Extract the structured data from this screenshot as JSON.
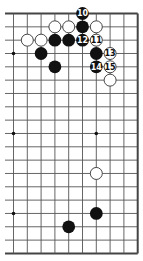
{
  "diagram": {
    "type": "go-board-partial",
    "board_size": 19,
    "visible_columns": [
      9,
      18
    ],
    "visible_rows": [
      0,
      18
    ],
    "edges": {
      "top": true,
      "right": true,
      "bottom": true,
      "left": false
    },
    "colors": {
      "line": "#555555",
      "edge": "#444444",
      "black": "#111111",
      "white": "#ffffff",
      "white_outline": "#333333",
      "background": "#ffffff"
    },
    "star_points": [
      {
        "col": 9,
        "row": 3
      },
      {
        "col": 9,
        "row": 9
      },
      {
        "col": 9,
        "row": 15
      },
      {
        "col": 15,
        "row": 9
      }
    ],
    "stones": [
      {
        "color": "black",
        "col": 14,
        "row": 0,
        "label": "10"
      },
      {
        "color": "white",
        "col": 12,
        "row": 1,
        "label": ""
      },
      {
        "color": "white",
        "col": 13,
        "row": 1,
        "label": ""
      },
      {
        "color": "black",
        "col": 14,
        "row": 1,
        "label": ""
      },
      {
        "color": "white",
        "col": 15,
        "row": 1,
        "label": ""
      },
      {
        "color": "white",
        "col": 10,
        "row": 2,
        "label": ""
      },
      {
        "color": "white",
        "col": 11,
        "row": 2,
        "label": ""
      },
      {
        "color": "black",
        "col": 12,
        "row": 2,
        "label": ""
      },
      {
        "color": "black",
        "col": 13,
        "row": 2,
        "label": ""
      },
      {
        "color": "black",
        "col": 14,
        "row": 2,
        "label": "12"
      },
      {
        "color": "white",
        "col": 15,
        "row": 2,
        "label": "11"
      },
      {
        "color": "black",
        "col": 11,
        "row": 3,
        "label": ""
      },
      {
        "color": "black",
        "col": 15,
        "row": 3,
        "label": ""
      },
      {
        "color": "white",
        "col": 16,
        "row": 3,
        "label": "13"
      },
      {
        "color": "black",
        "col": 12,
        "row": 4,
        "label": ""
      },
      {
        "color": "black",
        "col": 15,
        "row": 4,
        "label": "14"
      },
      {
        "color": "white",
        "col": 16,
        "row": 4,
        "label": "15"
      },
      {
        "color": "white",
        "col": 16,
        "row": 5,
        "label": ""
      },
      {
        "color": "white",
        "col": 15,
        "row": 12,
        "label": ""
      },
      {
        "color": "black",
        "col": 15,
        "row": 15,
        "label": ""
      },
      {
        "color": "black",
        "col": 13,
        "row": 16,
        "label": ""
      }
    ]
  }
}
